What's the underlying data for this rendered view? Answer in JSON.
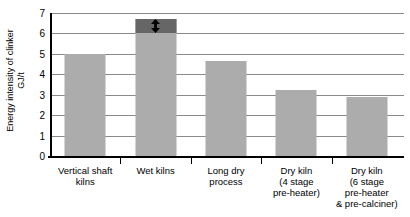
{
  "chart_data": {
    "type": "bar",
    "title": "",
    "subtitle": "",
    "xlabel": "",
    "ylabel": "Energy intensity of clinker GJ/t",
    "ylabel_lines": [
      "Energy intensity of clinker",
      "GJ/t"
    ],
    "ylim": [
      0,
      7
    ],
    "ytick_step": 1,
    "yticks": [
      "7",
      "6",
      "5",
      "4",
      "3",
      "2",
      "1",
      "0"
    ],
    "grid": true,
    "legend": "none",
    "bar_color": "#acacac",
    "range_band_color": "#666666",
    "gridline_color": "#8a8a8a",
    "axis_color": "#000000",
    "categories": [
      "Vertical shaft kilns",
      "Wet kilns",
      "Long dry process",
      "Dry kiln (4 stage pre-heater)",
      "Dry kiln (6 stage pre-heater & pre-calciner)"
    ],
    "category_lines": [
      [
        "Vertical shaft",
        "kilns"
      ],
      [
        "Wet kilns"
      ],
      [
        "Long dry",
        "process"
      ],
      [
        "Dry kiln",
        "(4 stage",
        "pre-heater)"
      ],
      [
        "Dry kiln",
        "(6 stage",
        "pre-heater",
        "& pre-calciner)"
      ]
    ],
    "values": [
      5.0,
      6.7,
      4.65,
      3.25,
      2.9
    ],
    "annotations": [
      {
        "category": "Wet kilns",
        "type": "range-band",
        "icon": "double-headed-vertical-arrow",
        "low": 6.0,
        "high": 6.7
      }
    ]
  }
}
